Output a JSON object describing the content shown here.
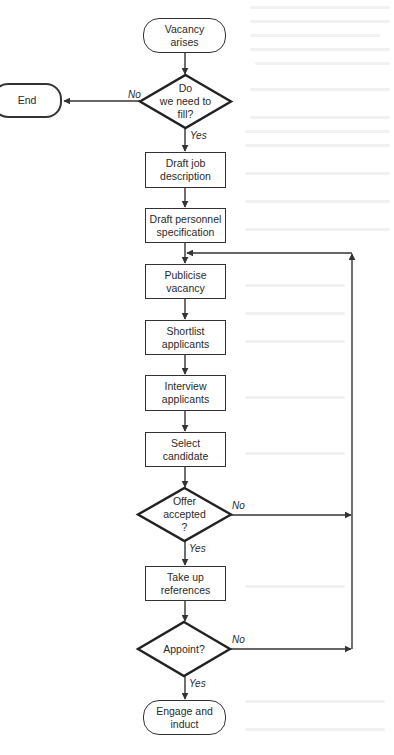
{
  "diagram": {
    "type": "flowchart",
    "colors": {
      "stroke": "#333333",
      "text": "#2a2a2a",
      "background": "#ffffff"
    },
    "nodes": {
      "start": "Vacancy\narises",
      "need_fill": "Do\nwe need to\nfill?",
      "end": "End",
      "draft_job": "Draft job\ndescription",
      "draft_spec": "Draft personnel\nspecification",
      "publicise": "Publicise\nvacancy",
      "shortlist": "Shortlist\napplicants",
      "interview": "Interview\napplicants",
      "select": "Select\ncandidate",
      "offer": "Offer\naccepted\n?",
      "references": "Take up\nreferences",
      "appoint": "Appoint?",
      "engage": "Engage and\ninduct"
    },
    "labels": {
      "need_fill_no": "No",
      "need_fill_yes": "Yes",
      "offer_no": "No",
      "offer_yes": "Yes",
      "appoint_no": "No",
      "appoint_yes": "Yes"
    },
    "edges": [
      {
        "from": "start",
        "to": "need_fill"
      },
      {
        "from": "need_fill",
        "to": "end",
        "label": "No"
      },
      {
        "from": "need_fill",
        "to": "draft_job",
        "label": "Yes"
      },
      {
        "from": "draft_job",
        "to": "draft_spec"
      },
      {
        "from": "draft_spec",
        "to": "publicise"
      },
      {
        "from": "publicise",
        "to": "shortlist"
      },
      {
        "from": "shortlist",
        "to": "interview"
      },
      {
        "from": "interview",
        "to": "select"
      },
      {
        "from": "select",
        "to": "offer"
      },
      {
        "from": "offer",
        "to": "publicise",
        "label": "No"
      },
      {
        "from": "offer",
        "to": "references",
        "label": "Yes"
      },
      {
        "from": "references",
        "to": "appoint"
      },
      {
        "from": "appoint",
        "to": "publicise",
        "label": "No"
      },
      {
        "from": "appoint",
        "to": "engage",
        "label": "Yes"
      }
    ]
  }
}
